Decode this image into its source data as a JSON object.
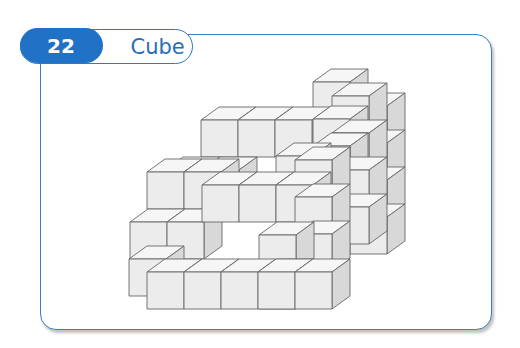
{
  "header": {
    "number": "22",
    "title": "Cube"
  },
  "colors": {
    "accent": "#1f72c6",
    "border": "#3b7fc0",
    "front": "#ececec",
    "top": "#f6f6f6",
    "side": "#d8d8d8",
    "edge": "#666666"
  },
  "diagram": {
    "size": 37,
    "depth": [
      18,
      -13
    ],
    "cubes": [
      [
        350,
        106
      ],
      [
        350,
        143
      ],
      [
        350,
        180
      ],
      [
        350,
        217
      ],
      [
        313,
        82
      ],
      [
        332,
        96
      ],
      [
        201,
        120
      ],
      [
        238,
        120
      ],
      [
        275,
        120
      ],
      [
        313,
        119
      ],
      [
        332,
        133
      ],
      [
        165,
        170
      ],
      [
        202,
        170
      ],
      [
        147,
        172
      ],
      [
        184,
        172
      ],
      [
        313,
        146
      ],
      [
        332,
        170
      ],
      [
        332,
        207
      ],
      [
        276,
        156
      ],
      [
        295,
        160
      ],
      [
        130,
        222
      ],
      [
        167,
        222
      ],
      [
        129,
        259
      ],
      [
        202,
        185
      ],
      [
        239,
        185
      ],
      [
        276,
        185
      ],
      [
        295,
        197
      ],
      [
        295,
        234
      ],
      [
        259,
        235
      ],
      [
        259,
        272
      ],
      [
        147,
        272
      ],
      [
        184,
        272
      ],
      [
        221,
        272
      ],
      [
        258,
        272
      ],
      [
        295,
        272
      ]
    ]
  }
}
